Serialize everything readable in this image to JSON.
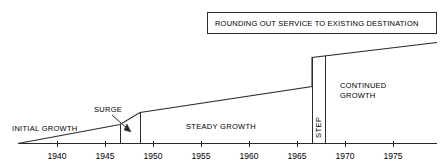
{
  "chart_data": {
    "type": "line",
    "title": "",
    "xlabel": "",
    "ylabel": "",
    "xlim": [
      1937,
      1978
    ],
    "grid": false,
    "legend": null,
    "x_ticks": [
      1940,
      1945,
      1950,
      1955,
      1960,
      1965,
      1970,
      1975
    ],
    "x_tick_labels": [
      "1940",
      "1945",
      "1950",
      "1955",
      "1960",
      "1965",
      "1970",
      "1975"
    ],
    "series": [
      {
        "name": "Service growth",
        "x": [
          1937,
          1948,
          1950,
          1967,
          1967,
          1978
        ],
        "y": [
          0,
          9,
          24,
          52,
          72,
          87
        ],
        "description": "Piecewise growth curve: slow initial rise, a surge, steady growth, a vertical step, then continued growth."
      }
    ],
    "phases": [
      {
        "name": "INITIAL GROWTH",
        "start": 1937,
        "end": 1948
      },
      {
        "name": "SURGE",
        "start": 1948,
        "end": 1950
      },
      {
        "name": "STEADY GROWTH",
        "start": 1950,
        "end": 1967
      },
      {
        "name": "STEP",
        "start": 1967,
        "end": 1968
      },
      {
        "name": "CONTINUED GROWTH",
        "start": 1968,
        "end": 1978
      }
    ]
  },
  "annotations": {
    "callout_box": {
      "text": "ROUNDING OUT SERVICE TO EXISTING DESTINATION"
    },
    "initial_growth": {
      "text": "INITIAL GROWTH"
    },
    "surge": {
      "text": "SURGE"
    },
    "steady_growth": {
      "text": "STEADY GROWTH"
    },
    "step": {
      "text": "STEP"
    },
    "continued_growth": {
      "line1": "CONTINUED",
      "line2": "GROWTH"
    }
  },
  "axis": {
    "ticks": [
      {
        "label": "1940",
        "x": 57
      },
      {
        "label": "1945",
        "x": 105
      },
      {
        "label": "1950",
        "x": 153
      },
      {
        "label": "1955",
        "x": 201
      },
      {
        "label": "1960",
        "x": 249
      },
      {
        "label": "1965",
        "x": 297
      },
      {
        "label": "1970",
        "x": 345
      },
      {
        "label": "1975",
        "x": 393
      }
    ]
  },
  "colors": {
    "stroke": "#2b2b2b",
    "background": "#ffffff",
    "text": "#000000"
  }
}
